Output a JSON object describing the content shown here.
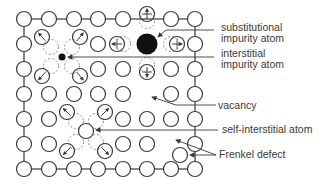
{
  "diagram": {
    "colors": {
      "stroke": "#3a3a3a",
      "dashed": "#8a8a8a",
      "fill_atom": "#ffffff",
      "impurity": "#111111",
      "text": "#3a3a3a"
    },
    "lattice": {
      "columns": [
        24,
        49,
        74,
        98,
        123,
        147,
        171,
        195
      ],
      "rows": [
        19,
        44,
        69,
        94,
        119,
        144,
        169
      ],
      "atom_radius": 7.5
    },
    "atoms": [
      {
        "x": 24,
        "y": 19
      },
      {
        "x": 49,
        "y": 19
      },
      {
        "x": 74,
        "y": 19
      },
      {
        "x": 98,
        "y": 19
      },
      {
        "x": 123,
        "y": 19
      },
      {
        "x": 171,
        "y": 19
      },
      {
        "x": 195,
        "y": 19
      },
      {
        "x": 24,
        "y": 44
      },
      {
        "x": 98,
        "y": 44
      },
      {
        "x": 195,
        "y": 44
      },
      {
        "x": 24,
        "y": 69
      },
      {
        "x": 98,
        "y": 69
      },
      {
        "x": 123,
        "y": 69
      },
      {
        "x": 171,
        "y": 69
      },
      {
        "x": 195,
        "y": 69
      },
      {
        "x": 24,
        "y": 94
      },
      {
        "x": 49,
        "y": 94
      },
      {
        "x": 74,
        "y": 94
      },
      {
        "x": 98,
        "y": 94
      },
      {
        "x": 123,
        "y": 94
      },
      {
        "x": 171,
        "y": 94
      },
      {
        "x": 195,
        "y": 94
      },
      {
        "x": 24,
        "y": 119
      },
      {
        "x": 49,
        "y": 119
      },
      {
        "x": 123,
        "y": 119
      },
      {
        "x": 147,
        "y": 119
      },
      {
        "x": 171,
        "y": 119
      },
      {
        "x": 195,
        "y": 119
      },
      {
        "x": 24,
        "y": 144
      },
      {
        "x": 49,
        "y": 144
      },
      {
        "x": 123,
        "y": 144
      },
      {
        "x": 147,
        "y": 144
      },
      {
        "x": 195,
        "y": 144
      },
      {
        "x": 24,
        "y": 169
      },
      {
        "x": 49,
        "y": 169
      },
      {
        "x": 74,
        "y": 169
      },
      {
        "x": 98,
        "y": 169
      },
      {
        "x": 123,
        "y": 169
      },
      {
        "x": 147,
        "y": 169
      },
      {
        "x": 171,
        "y": 169
      },
      {
        "x": 195,
        "y": 169
      }
    ],
    "displaced_atoms": [
      {
        "from": [
          147,
          21
        ],
        "to": [
          147,
          14
        ],
        "arrow": "up"
      },
      {
        "from": [
          123,
          44
        ],
        "to": [
          117,
          44
        ],
        "arrow": "left"
      },
      {
        "from": [
          171,
          44
        ],
        "to": [
          177,
          44
        ],
        "arrow": "right"
      },
      {
        "from": [
          147,
          65
        ],
        "to": [
          147,
          72
        ],
        "arrow": "down"
      },
      {
        "from": [
          51,
          47
        ],
        "to": [
          42,
          37
        ],
        "arrow": "diag"
      },
      {
        "from": [
          72,
          47
        ],
        "to": [
          80,
          37
        ],
        "arrow": "diag"
      },
      {
        "from": [
          51,
          66
        ],
        "to": [
          42,
          76
        ],
        "arrow": "diag"
      },
      {
        "from": [
          72,
          66
        ],
        "to": [
          80,
          76
        ],
        "arrow": "diag"
      },
      {
        "from": [
          76,
          121
        ],
        "to": [
          67,
          112
        ],
        "arrow": "diag"
      },
      {
        "from": [
          96,
          121
        ],
        "to": [
          105,
          112
        ],
        "arrow": "diag"
      },
      {
        "from": [
          76,
          142
        ],
        "to": [
          67,
          151
        ],
        "arrow": "diag"
      },
      {
        "from": [
          96,
          142
        ],
        "to": [
          105,
          151
        ],
        "arrow": "diag"
      }
    ],
    "substitutional_impurity": {
      "x": 147,
      "y": 44,
      "r": 10.5
    },
    "interstitial_impurity": {
      "x": 62,
      "y": 57,
      "r": 3.5
    },
    "self_interstitial": {
      "x": 86,
      "y": 131,
      "r": 7.5
    },
    "frenkel_interstitial": {
      "x": 180,
      "y": 155,
      "r": 7.5
    },
    "vacancy_sites": [
      {
        "x": 147,
        "y": 94
      },
      {
        "x": 171,
        "y": 144
      }
    ],
    "bond_frame": {
      "top": 19,
      "bottom": 169,
      "left": 24,
      "right": 195
    }
  },
  "labels": {
    "substitutional": {
      "line1": "substitutional",
      "line2": "impurity atom"
    },
    "interstitial": {
      "line1": "interstitial",
      "line2": "impurity atom"
    },
    "vacancy": "vacancy",
    "self_interstitial": "self-interstitial atom",
    "frenkel": "Frenkel defect"
  }
}
